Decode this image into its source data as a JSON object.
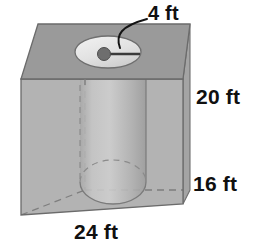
{
  "figure": {
    "shape_names": {
      "prism": "rectangular-prism",
      "cylinder": "cylinder-hole",
      "opening": "cylinder-top-opening",
      "center_dot": "cylinder-center-point",
      "radius_line": "cylinder-radius-segment",
      "leader": "leader-line"
    },
    "labels": {
      "radius": "4 ft",
      "height": "20 ft",
      "depth": "16 ft",
      "width": "24 ft"
    },
    "measurements": [
      {
        "name": "radius",
        "value": 4,
        "unit": "ft",
        "text": "4 ft"
      },
      {
        "name": "height",
        "value": 20,
        "unit": "ft",
        "text": "20 ft"
      },
      {
        "name": "depth",
        "value": 16,
        "unit": "ft",
        "text": "16 ft"
      },
      {
        "name": "width",
        "value": 24,
        "unit": "ft",
        "text": "24 ft"
      }
    ],
    "colors": {
      "top_face": "#9a9a9a",
      "front_face": "#b2b2b2",
      "side_face": "#a4a4a4",
      "cylinder_body": "#bdbdbd",
      "opening_fill": "#e9e9e9",
      "center_dot": "#6e6e6e",
      "outline": "#6b6b6b",
      "hidden_line": "#8a8a8a",
      "text": "#101010",
      "background": "#ffffff"
    }
  }
}
